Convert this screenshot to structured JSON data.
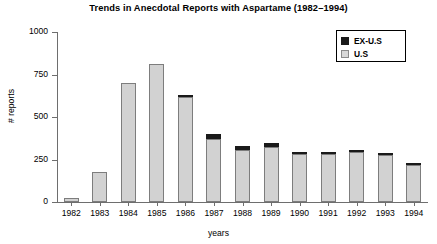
{
  "chart_data": {
    "type": "bar",
    "title": "Trends in Anecdotal Reports with Aspartame (1982–1994)",
    "xlabel": "years",
    "ylabel": "# reports",
    "ylim": [
      0,
      1000
    ],
    "yticks": [
      0,
      250,
      500,
      750,
      1000
    ],
    "ytick_labels": [
      "0",
      "250",
      "500",
      "750",
      "1000"
    ],
    "grid": false,
    "stacked": true,
    "legend_position": "top-right",
    "categories": [
      "1982",
      "1983",
      "1984",
      "1985",
      "1986",
      "1987",
      "1988",
      "1989",
      "1990",
      "1991",
      "1992",
      "1993",
      "1994"
    ],
    "series": [
      {
        "name": "U.S",
        "color": "#d2d2d2",
        "values": [
          22,
          175,
          700,
          810,
          615,
          370,
          305,
          325,
          285,
          285,
          295,
          275,
          215
        ]
      },
      {
        "name": "EX-U.S",
        "color": "#1a1a1a",
        "values": [
          0,
          0,
          0,
          0,
          15,
          30,
          25,
          25,
          10,
          10,
          10,
          10,
          10
        ]
      }
    ],
    "totals": [
      22,
      175,
      700,
      810,
      630,
      400,
      330,
      350,
      295,
      295,
      305,
      285,
      225
    ]
  },
  "legend": {
    "entries": [
      {
        "label": "EX-U.S",
        "swatch": "black-square-swatch"
      },
      {
        "label": "U.S",
        "swatch": "gray-square-swatch"
      }
    ]
  }
}
